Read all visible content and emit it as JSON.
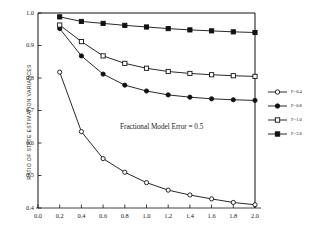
{
  "chart_data": {
    "type": "line",
    "title": "",
    "xlabel": "",
    "ylabel": "RATIO OF STATE ESTIMATION VARIANCES",
    "xlim": [
      0.0,
      2.0
    ],
    "ylim": [
      0.4,
      1.0
    ],
    "xticks": [
      "0.0",
      "0.2",
      "0.4",
      "0.6",
      "0.8",
      "1.0",
      "1.2",
      "1.4",
      "1.6",
      "1.8",
      "2.0"
    ],
    "yticks": [
      "0.4",
      "0.5",
      "0.6",
      "0.7",
      "0.8",
      "0.9",
      "1.0"
    ],
    "grid": false,
    "legend_position": "right",
    "annotations": [
      "Fractional Model Error = 0.5"
    ],
    "x": [
      0.2,
      0.4,
      0.6,
      0.8,
      1.0,
      1.2,
      1.4,
      1.6,
      1.8,
      2.0
    ],
    "series": [
      {
        "name": "F=0.4",
        "marker": "open-circle",
        "values": [
          0.818,
          0.635,
          0.552,
          0.51,
          0.478,
          0.455,
          0.44,
          0.428,
          0.417,
          0.41
        ]
      },
      {
        "name": "F=0.8",
        "marker": "filled-circle",
        "values": [
          0.952,
          0.868,
          0.812,
          0.778,
          0.76,
          0.748,
          0.741,
          0.736,
          0.733,
          0.731
        ]
      },
      {
        "name": "F=1.0",
        "marker": "open-square",
        "values": [
          0.963,
          0.912,
          0.868,
          0.845,
          0.83,
          0.82,
          0.814,
          0.81,
          0.807,
          0.805
        ]
      },
      {
        "name": "F=2.0",
        "marker": "filled-square",
        "values": [
          0.988,
          0.974,
          0.968,
          0.962,
          0.957,
          0.952,
          0.948,
          0.945,
          0.942,
          0.94
        ]
      }
    ]
  },
  "legend": {
    "entries": [
      {
        "label": "F=0.4"
      },
      {
        "label": "F=0.8"
      },
      {
        "label": "F=1.0"
      },
      {
        "label": "F=2.0"
      }
    ]
  }
}
